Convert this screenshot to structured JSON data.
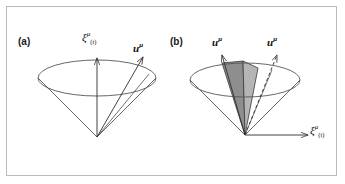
{
  "figure": {
    "width": 345,
    "height": 184,
    "background": "#ffffff",
    "border_color": "#b9b9bb",
    "type": "light-cone-diagram"
  },
  "panels": [
    {
      "id": "a",
      "label": "(a)",
      "description": "Light cone with timelike Killing vector and four-velocity",
      "cone": {
        "apex": [
          97,
          137
        ],
        "rim_center": [
          97,
          78
        ],
        "rim_rx": 59,
        "rim_ry": 18,
        "stroke": "#4a4a52"
      },
      "vectors": [
        {
          "name": "xi-t",
          "label_base": "ξ",
          "label_sup": "μ",
          "label_sub": "(t)",
          "style": "solid",
          "from": [
            97,
            137
          ],
          "to": [
            97,
            58
          ]
        },
        {
          "name": "u",
          "label_base": "u",
          "label_sup": "μ",
          "label_sub": "",
          "style": "solid",
          "from": [
            97,
            137
          ],
          "to": [
            142,
            57
          ]
        }
      ]
    },
    {
      "id": "b",
      "label": "(b)",
      "description": "Light cone with two four-velocities spanning a shaded wedge",
      "cone": {
        "apex": [
          245,
          135
        ],
        "rim_center": [
          245,
          80
        ],
        "rim_rx": 55,
        "rim_ry": 17,
        "stroke": "#4a4a52"
      },
      "shaded_wedge": {
        "dark_fill": "#8e8e8e",
        "light_fill": "#b5b5b5",
        "edge": "#3a3a3a"
      },
      "vectors": [
        {
          "name": "u-1",
          "label_base": "u",
          "label_sup": "μ",
          "label_sub": "",
          "style": "solid",
          "from": [
            245,
            135
          ],
          "to": [
            222,
            55
          ]
        },
        {
          "name": "u-2",
          "label_base": "u",
          "label_sup": "μ",
          "label_sub": "",
          "style": "dashed",
          "from": [
            245,
            135
          ],
          "to": [
            277,
            55
          ]
        },
        {
          "name": "xi-t",
          "label_base": "ξ",
          "label_sup": "μ",
          "label_sub": "(t)",
          "style": "solid",
          "from": [
            245,
            135
          ],
          "to": [
            306,
            135
          ]
        }
      ]
    }
  ]
}
